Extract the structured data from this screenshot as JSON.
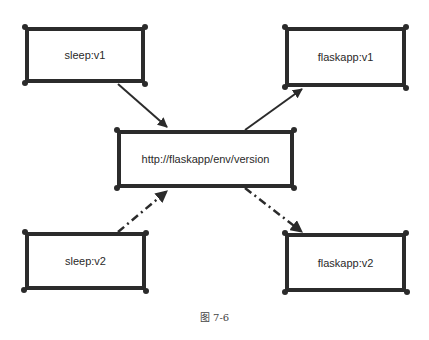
{
  "diagram": {
    "nodes": [
      {
        "id": "sleep-v1",
        "label": "sleep:v1"
      },
      {
        "id": "flaskapp-v1",
        "label": "flaskapp:v1"
      },
      {
        "id": "center",
        "label": "http://flaskapp/env/version"
      },
      {
        "id": "sleep-v2",
        "label": "sleep:v2"
      },
      {
        "id": "flaskapp-v2",
        "label": "flaskapp:v2"
      }
    ],
    "edges": [
      {
        "from": "sleep-v1",
        "to": "center",
        "style": "solid"
      },
      {
        "from": "center",
        "to": "flaskapp-v1",
        "style": "solid"
      },
      {
        "from": "sleep-v2",
        "to": "center",
        "style": "dash-dot"
      },
      {
        "from": "center",
        "to": "flaskapp-v2",
        "style": "dash-dot"
      }
    ],
    "caption": "图 7-6"
  },
  "colors": {
    "stroke": "#2b2b2b",
    "text": "#2a2a2a",
    "background": "#ffffff"
  }
}
